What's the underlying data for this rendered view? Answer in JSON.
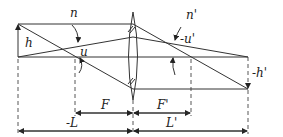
{
  "diagram": {
    "type": "thin-lens-ray-diagram",
    "labels": {
      "n": "n",
      "n_prime": "n'",
      "u": "u",
      "u_prime": "-u'",
      "h": "h",
      "h_prime": "-h'",
      "F": "F",
      "F_prime": "F'",
      "L": "-L",
      "L_prime": "L'"
    },
    "colors": {
      "line": "#333333",
      "background": "#ffffff"
    }
  }
}
